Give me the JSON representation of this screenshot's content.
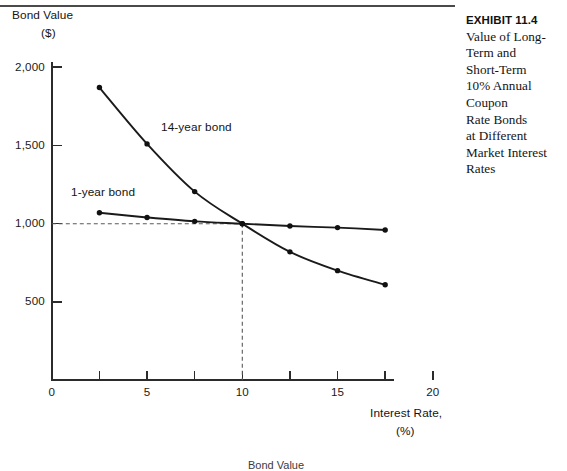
{
  "exhibit": {
    "number_label": "EXHIBIT 11.4",
    "caption_lines": [
      "Value of Long-",
      "Term and",
      "Short-Term",
      "10% Annual",
      "Coupon",
      "Rate Bonds",
      "at Different",
      "Market Interest",
      "Rates"
    ]
  },
  "axes": {
    "y_title_line1": "Bond Value",
    "y_title_line2": "($)",
    "x_title_line1": "Interest Rate,",
    "x_title_line2": "(%)",
    "y_ticks": [
      {
        "value": 2000,
        "label": "2,000"
      },
      {
        "value": 1500,
        "label": "1,500"
      },
      {
        "value": 1000,
        "label": "1,000"
      },
      {
        "value": 500,
        "label": "500"
      }
    ],
    "x_ticks": [
      {
        "value": 0,
        "label": "0"
      },
      {
        "value": 2.5,
        "label": ""
      },
      {
        "value": 5,
        "label": "5"
      },
      {
        "value": 7.5,
        "label": ""
      },
      {
        "value": 10,
        "label": "10"
      },
      {
        "value": 12.5,
        "label": ""
      },
      {
        "value": 15,
        "label": "15"
      },
      {
        "value": 17.5,
        "label": ""
      },
      {
        "value": 20,
        "label": "20"
      }
    ]
  },
  "annotations": {
    "series_label_long": "14-year bond",
    "series_label_short": "1-year bond",
    "bottom_bleed_text": "Bond Value"
  },
  "colors": {
    "axis": "#2b2b2b",
    "curve": "#1a1a1a",
    "marker": "#111111",
    "guide_dashed": "#5a5a5a",
    "rule": "#4a4a4a"
  },
  "chart_data": {
    "type": "line",
    "xlabel": "Interest Rate, (%)",
    "ylabel": "Bond Value ($)",
    "xlim": [
      0,
      20
    ],
    "ylim": [
      0,
      2200
    ],
    "grid": false,
    "legend": "inline-annotations",
    "x": [
      2.5,
      5,
      7.5,
      10,
      12.5,
      15,
      17.5
    ],
    "series": [
      {
        "name": "14-year bond",
        "values": [
          1870,
          1510,
          1205,
          1000,
          820,
          700,
          610
        ]
      },
      {
        "name": "1-year bond",
        "values": [
          1070,
          1040,
          1015,
          1000,
          985,
          975,
          960
        ]
      }
    ],
    "reference_lines": [
      {
        "axis": "y",
        "value": 1000,
        "style": "dashed"
      },
      {
        "axis": "x",
        "value": 10,
        "style": "dashed"
      }
    ],
    "intersection": {
      "x": 10,
      "y": 1000
    }
  }
}
